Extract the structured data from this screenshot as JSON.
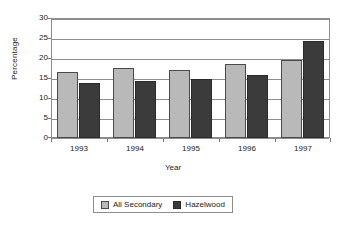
{
  "chart_data": {
    "type": "bar",
    "title": "",
    "xlabel": "Year",
    "ylabel": "Percentage",
    "categories": [
      "1993",
      "1994",
      "1995",
      "1996",
      "1997"
    ],
    "series": [
      {
        "name": "All Secondary",
        "color": "#b9b9b9",
        "values": [
          16.7,
          17.6,
          17.2,
          18.7,
          19.7
        ]
      },
      {
        "name": "Hazelwood",
        "color": "#3b3b3b",
        "values": [
          13.8,
          14.3,
          14.8,
          15.8,
          24.4
        ]
      }
    ],
    "ylim": [
      0,
      30
    ],
    "ytick_step": 5,
    "yticks": [
      "30",
      "25",
      "20",
      "15",
      "10",
      "5",
      "0"
    ],
    "grid": true,
    "legend_position": "bottom"
  },
  "legend": {
    "items": [
      {
        "label": "All Secondary",
        "swatch": "light"
      },
      {
        "label": "Hazelwood",
        "swatch": "dark"
      }
    ]
  }
}
